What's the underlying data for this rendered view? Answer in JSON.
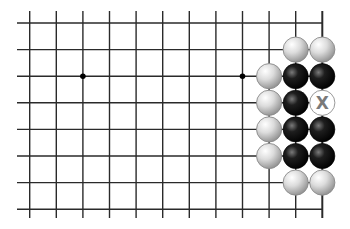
{
  "diagram": {
    "type": "go-board-fragment",
    "grid": {
      "columns_x": [
        29.7,
        56.3,
        82.9,
        109.5,
        136.1,
        162.7,
        189.3,
        215.9,
        242.5,
        269.1,
        295.7,
        322.3
      ],
      "rows_y": [
        23,
        49.6,
        76.2,
        102.8,
        129.4,
        156,
        182.6,
        209.2
      ],
      "line_color": "#2a2a2a",
      "right_edge": true,
      "open_left": true,
      "open_top": true,
      "open_bottom": true
    },
    "star_points": [
      {
        "col": 2,
        "row": 2
      },
      {
        "col": 8,
        "row": 2
      }
    ],
    "stones": [
      {
        "col": 10,
        "row": 1,
        "color": "white"
      },
      {
        "col": 11,
        "row": 1,
        "color": "white"
      },
      {
        "col": 9,
        "row": 2,
        "color": "white"
      },
      {
        "col": 10,
        "row": 2,
        "color": "black"
      },
      {
        "col": 11,
        "row": 2,
        "color": "black"
      },
      {
        "col": 9,
        "row": 3,
        "color": "white"
      },
      {
        "col": 10,
        "row": 3,
        "color": "black"
      },
      {
        "col": 9,
        "row": 4,
        "color": "white"
      },
      {
        "col": 10,
        "row": 4,
        "color": "black"
      },
      {
        "col": 11,
        "row": 4,
        "color": "black"
      },
      {
        "col": 9,
        "row": 5,
        "color": "white"
      },
      {
        "col": 10,
        "row": 5,
        "color": "black"
      },
      {
        "col": 11,
        "row": 5,
        "color": "black"
      },
      {
        "col": 10,
        "row": 6,
        "color": "white"
      },
      {
        "col": 11,
        "row": 6,
        "color": "white"
      }
    ],
    "markers": [
      {
        "col": 11,
        "row": 3,
        "label": "X",
        "style": "hollow-circle"
      }
    ],
    "stone_radius": 12.6,
    "colors": {
      "white_stone_light": "#f2f2f2",
      "white_stone_dark": "#9a9a9a",
      "black_stone_light": "#6a6a6a",
      "black_stone_dark": "#050505",
      "marker_text": "#7a7a7a"
    }
  }
}
